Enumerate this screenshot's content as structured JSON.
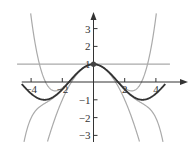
{
  "chart_data": {
    "type": "line",
    "title": "",
    "xlabel": "",
    "ylabel": "",
    "xlim": [
      -4.5,
      4.5
    ],
    "ylim": [
      -3.3,
      3.6
    ],
    "grid": false,
    "x_ticks": [
      -4,
      -2,
      2,
      4
    ],
    "y_ticks": [
      -3,
      -2,
      -1,
      1,
      2,
      3
    ],
    "x_tick_labels": [
      "−4",
      "−2",
      "2",
      "4"
    ],
    "y_tick_labels": [
      "−3",
      "−2",
      "−1",
      "1",
      "2",
      "3"
    ],
    "series": [
      {
        "name": "f(x) = cos x",
        "style": "dark",
        "color": "#333333"
      },
      {
        "name": "P0(x) = 1",
        "style": "light",
        "color": "#aaaaaa"
      },
      {
        "name": "P2(x) = 1 − x²/2",
        "style": "light",
        "color": "#aaaaaa"
      },
      {
        "name": "P4(x) = 1 − x²/2 + x⁴/24",
        "style": "light",
        "color": "#aaaaaa"
      },
      {
        "name": "P6(x) = 1 − x²/2 + x⁴/24 − x⁶/720",
        "style": "light",
        "color": "#aaaaaa"
      }
    ],
    "annotations": [
      {
        "type": "point",
        "x": 0,
        "y": 1
      }
    ]
  }
}
